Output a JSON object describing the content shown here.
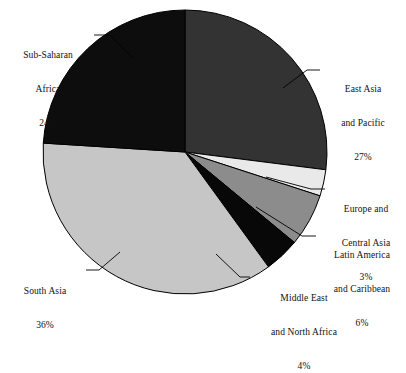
{
  "chart_data": {
    "type": "pie",
    "title": "",
    "subtitle": "",
    "xlabel": "",
    "ylabel": "",
    "legend_position": "callout-labels",
    "grid": false,
    "units": "percent",
    "start_angle_deg": 0,
    "direction": "clockwise",
    "categories": [
      "East Asia and Pacific",
      "Europe and Central Asia",
      "Latin America and Caribbean",
      "Middle East and North Africa",
      "South Asia",
      "Sub-Saharan Africa"
    ],
    "values": [
      27,
      3,
      6,
      4,
      36,
      24
    ],
    "slices": [
      {
        "name": "east-asia-pacific",
        "label_lines": [
          "East Asia",
          "and Pacific"
        ],
        "percent_text": "27%",
        "value": 27,
        "color": "#333333",
        "start_deg": 0,
        "end_deg": 97.2
      },
      {
        "name": "europe-central-asia",
        "label_lines": [
          "Europe and",
          "Central Asia"
        ],
        "percent_text": "3%",
        "value": 3,
        "color": "#e9e9e9",
        "start_deg": 97.2,
        "end_deg": 108.0
      },
      {
        "name": "latin-america-caribbean",
        "label_lines": [
          "Latin America",
          "and Caribbean"
        ],
        "percent_text": "6%",
        "value": 6,
        "color": "#8c8c8c",
        "start_deg": 108.0,
        "end_deg": 129.6
      },
      {
        "name": "middle-east-north-africa",
        "label_lines": [
          "Middle East",
          "and North Africa"
        ],
        "percent_text": "4%",
        "value": 4,
        "color": "#080808",
        "start_deg": 129.6,
        "end_deg": 144.0
      },
      {
        "name": "south-asia",
        "label_lines": [
          "South Asia"
        ],
        "percent_text": "36%",
        "value": 36,
        "color": "#c6c6c6",
        "start_deg": 144.0,
        "end_deg": 273.6
      },
      {
        "name": "sub-saharan-africa",
        "label_lines": [
          "Sub-Saharan",
          "Africa"
        ],
        "percent_text": "24%",
        "value": 24,
        "color": "#0d0d0d",
        "start_deg": 273.6,
        "end_deg": 360.0
      }
    ]
  },
  "labels": {
    "sub_saharan_africa": {
      "line1": "Sub-Saharan",
      "line2": "Africa",
      "percent": "24%"
    },
    "east_asia_pacific": {
      "line1": "East Asia",
      "line2": "and Pacific",
      "percent": "27%"
    },
    "europe_central_asia": {
      "line1": "Europe and",
      "line2": "Central Asia",
      "percent": "3%"
    },
    "latin_america_caribbean": {
      "line1": "Latin America",
      "line2": "and Caribbean",
      "percent": "6%"
    },
    "middle_east_north_africa": {
      "line1": "Middle East",
      "line2": "and North Africa",
      "percent": "4%"
    },
    "south_asia": {
      "line1": "South Asia",
      "percent": "36%"
    }
  },
  "colors": {
    "background": "#ffffff",
    "outline": "#000000",
    "text": "#111111",
    "slice_dark_gray": "#333333",
    "slice_near_black": "#0d0d0d",
    "slice_black": "#080808",
    "slice_medium_gray": "#8c8c8c",
    "slice_light_gray": "#c6c6c6",
    "slice_very_light": "#e9e9e9"
  },
  "geometry": {
    "center_x": 185,
    "center_y": 152,
    "radius": 142
  }
}
